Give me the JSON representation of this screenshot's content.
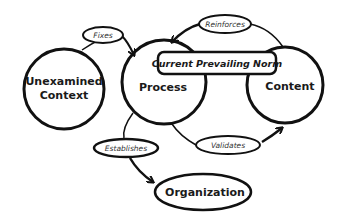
{
  "diagram": {
    "nodes": {
      "unexamined_context": {
        "line1": "Unexamined",
        "line2": "Context"
      },
      "process": {
        "label": "Process"
      },
      "content": {
        "label": "Content"
      },
      "organization": {
        "label": "Organization"
      },
      "norm": {
        "label": "Current Prevailing Norm"
      }
    },
    "edges": {
      "fixes": {
        "label": "Fixes",
        "from": "Unexamined Context",
        "to": "Process"
      },
      "reinforces": {
        "label": "Reinforces",
        "from": "Content",
        "to": "Process"
      },
      "validates": {
        "label": "Validates",
        "from": "Process",
        "to": "Content"
      },
      "establishes": {
        "label": "Establishes",
        "from": "Process",
        "to": "Organization"
      }
    },
    "colors": {
      "stroke": "#111111",
      "background": "#ffffff",
      "text": "#1a1a1a"
    }
  }
}
